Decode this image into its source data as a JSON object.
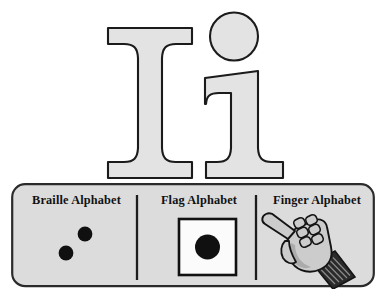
{
  "card": {
    "letter_pair": "Ii",
    "uppercase": "I",
    "lowercase": "i",
    "letter_fill": "#e3e3e3",
    "letter_outline": "#1b1b1b"
  },
  "panel": {
    "background": "#dcdcdc",
    "border_color": "#2b2b2b",
    "divider_color": "#1d1d1d",
    "sections": [
      {
        "id": "braille",
        "label": "Braille Alphabet",
        "icon_name": "braille-cell-icon",
        "dot_color": "#101010",
        "dots": [
          {
            "position": "upper-right",
            "cx": 74,
            "cy": 21,
            "r": 7.4
          },
          {
            "position": "lower-left",
            "cx": 55,
            "cy": 40,
            "r": 7.4
          }
        ]
      },
      {
        "id": "flag",
        "label": "Flag Alphabet",
        "icon_name": "semaphore-flag-icon",
        "flag_background": "#fbfbfb",
        "flag_border": "#101010",
        "flag_circle_color": "#101010",
        "circle_radius": 12.5
      },
      {
        "id": "finger",
        "label": "Finger Alphabet",
        "icon_name": "pointing-hand-icon",
        "hand_fill": "#cccccc",
        "hand_shade": "#9a9a9a",
        "hand_outline": "#141414",
        "cuff_color": "#2a2a2a"
      }
    ]
  }
}
